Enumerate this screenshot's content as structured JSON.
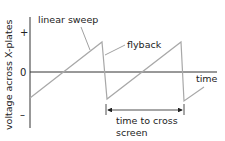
{
  "diagram": {
    "y_axis_label": "voltage across X-plates",
    "y_ticks": {
      "plus": "+",
      "zero": "0",
      "minus": "–"
    },
    "x_axis_label": "time",
    "annotations": {
      "linear_sweep": "linear sweep",
      "flyback": "flyback",
      "period_line1": "time to cross",
      "period_line2": "screen"
    },
    "colors": {
      "axis": "#333333",
      "waveform": "#a8a8a8",
      "leader": "#888888",
      "text": "#222222"
    }
  }
}
